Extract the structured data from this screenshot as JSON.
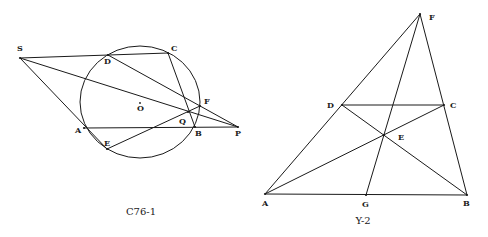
{
  "figures": [
    {
      "id": "left",
      "caption": "C76-1",
      "caption_pos": [
        141,
        215
      ],
      "circle": {
        "cx": 140,
        "cy": 102,
        "rx": 60,
        "ry": 56,
        "center_label": "O",
        "center_label_pos": [
          137,
          111
        ]
      },
      "points": {
        "S": {
          "x": 20,
          "y": 58,
          "label": "S",
          "lx": 17,
          "ly": 51
        },
        "D": {
          "x": 108,
          "y": 55,
          "label": "D",
          "lx": 104,
          "ly": 64
        },
        "C": {
          "x": 168,
          "y": 53,
          "label": "C",
          "lx": 171,
          "ly": 51
        },
        "F": {
          "x": 200,
          "y": 106,
          "label": "F",
          "lx": 204,
          "ly": 104
        },
        "Q": {
          "x": 188,
          "y": 112,
          "label": "Q",
          "lx": 179,
          "ly": 124
        },
        "B": {
          "x": 195,
          "y": 127,
          "label": "B",
          "lx": 195,
          "ly": 136
        },
        "P": {
          "x": 238,
          "y": 127,
          "label": "P",
          "lx": 235,
          "ly": 136
        },
        "A": {
          "x": 84,
          "y": 128,
          "label": "A",
          "lx": 75,
          "ly": 133
        },
        "E": {
          "x": 107,
          "y": 149,
          "label": "E",
          "lx": 104,
          "ly": 146
        }
      },
      "segments": [
        [
          "S",
          "C"
        ],
        [
          "S",
          "P"
        ],
        [
          "S",
          "E"
        ],
        [
          "D",
          "P"
        ],
        [
          "C",
          "B"
        ],
        [
          "A",
          "P"
        ],
        [
          "E",
          "F"
        ]
      ]
    },
    {
      "id": "right",
      "caption": "Y-2",
      "caption_pos": [
        363,
        224
      ],
      "points": {
        "F": {
          "x": 420,
          "y": 14,
          "label": "F",
          "lx": 429,
          "ly": 20
        },
        "D": {
          "x": 342,
          "y": 105,
          "label": "D",
          "lx": 327,
          "ly": 108
        },
        "C": {
          "x": 444,
          "y": 105,
          "label": "C",
          "lx": 450,
          "ly": 108
        },
        "E": {
          "x": 384,
          "y": 135,
          "label": "E",
          "lx": 398,
          "ly": 140
        },
        "A": {
          "x": 265,
          "y": 194,
          "label": "A",
          "lx": 262,
          "ly": 206
        },
        "G": {
          "x": 366,
          "y": 195,
          "label": "G",
          "lx": 362,
          "ly": 207
        },
        "B": {
          "x": 467,
          "y": 195,
          "label": "B",
          "lx": 463,
          "ly": 206
        }
      },
      "segments": [
        [
          "A",
          "F"
        ],
        [
          "F",
          "B"
        ],
        [
          "A",
          "B"
        ],
        [
          "D",
          "C"
        ],
        [
          "A",
          "C"
        ],
        [
          "D",
          "B"
        ],
        [
          "F",
          "G"
        ]
      ]
    }
  ]
}
